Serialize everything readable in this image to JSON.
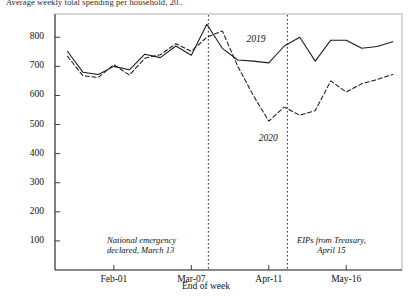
{
  "chart_data": {
    "type": "line",
    "title": "Average weekly total spending per household, 20..",
    "xlabel": "End of week",
    "ylabel": "",
    "ylim": [
      0,
      880
    ],
    "yticks": [
      100,
      200,
      300,
      400,
      500,
      600,
      700,
      800
    ],
    "xticks": [
      "Feb-01",
      "Mar-07",
      "Apr-11",
      "May-16"
    ],
    "xtick_weeks": [
      4,
      9,
      14,
      19
    ],
    "grid": false,
    "legend": "inline-labels",
    "x_weeks": [
      1,
      2,
      3,
      4,
      5,
      6,
      7,
      8,
      9,
      10,
      11,
      12,
      13,
      14,
      15,
      16,
      17,
      18,
      19,
      20,
      21,
      22
    ],
    "series": [
      {
        "name": "2019",
        "style": "solid",
        "color": "#1a1a1a",
        "values": [
          752,
          680,
          672,
          700,
          688,
          742,
          730,
          770,
          738,
          845,
          762,
          722,
          718,
          712,
          770,
          800,
          718,
          790,
          790,
          762,
          768,
          785
        ]
      },
      {
        "name": "2020",
        "style": "dashed",
        "color": "#1a1a1a",
        "values": [
          735,
          668,
          662,
          706,
          670,
          728,
          740,
          778,
          752,
          800,
          822,
          700,
          600,
          512,
          560,
          532,
          548,
          650,
          612,
          640,
          655,
          672
        ]
      }
    ],
    "annotations": [
      {
        "name": "national-emergency",
        "line1": "National emergency",
        "line2": "declared, March 13",
        "vline_week": 10.1
      },
      {
        "name": "eips-treasury",
        "line1": "EIPs from Treasury,",
        "line2": "April 15",
        "vline_week": 15.2
      }
    ],
    "series_labels": [
      {
        "text": "2019",
        "week": 13.2,
        "value": 790
      },
      {
        "text": "2020",
        "week": 14.0,
        "value": 450
      }
    ]
  }
}
